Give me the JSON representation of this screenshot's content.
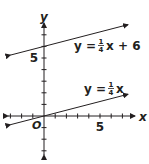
{
  "chart_data": {
    "type": "line",
    "title": "",
    "xlabel": "x",
    "ylabel": "y",
    "origin_label": "O",
    "xlim": [
      -3,
      8
    ],
    "ylim": [
      -4,
      8
    ],
    "x_tick_labels": [
      {
        "value": 5,
        "label": "5"
      }
    ],
    "y_tick_labels": [
      {
        "value": 5,
        "label": "5"
      }
    ],
    "x_ticks": [
      -3,
      -2,
      -1,
      1,
      2,
      3,
      4,
      5,
      6,
      7
    ],
    "y_ticks": [
      -3,
      -2,
      -1,
      1,
      2,
      3,
      4,
      5,
      6,
      7
    ],
    "grid": false,
    "series": [
      {
        "name": "y = 1/4 x + 6",
        "slope": 0.25,
        "intercept": 6,
        "x_range": [
          -3,
          7.5
        ],
        "label": {
          "prefix": "y = ",
          "num": "1",
          "den": "4",
          "suffix": "x + 6"
        }
      },
      {
        "name": "y = 1/4 x",
        "slope": 0.25,
        "intercept": 0,
        "x_range": [
          -3,
          7.5
        ],
        "label": {
          "prefix": "y = ",
          "num": "1",
          "den": "4",
          "suffix": "x"
        }
      }
    ],
    "colors": {
      "line": "#231f20",
      "axis": "#231f20"
    }
  }
}
